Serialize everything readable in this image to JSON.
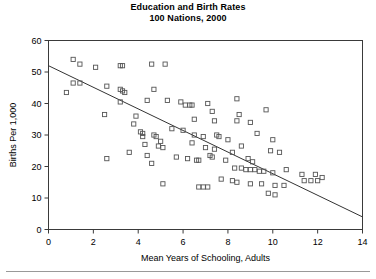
{
  "chart_data": {
    "type": "scatter",
    "title": "Education and Birth Rates",
    "subtitle": "100 Nations, 2000",
    "xlabel": "Mean Years of Schooling, Adults",
    "ylabel": "Births Per 1,000",
    "xlim": [
      0,
      14
    ],
    "ylim": [
      0,
      60
    ],
    "xticks": [
      0,
      2,
      4,
      6,
      8,
      10,
      12,
      14
    ],
    "yticks": [
      0,
      10,
      20,
      30,
      40,
      50,
      60
    ],
    "xtick_labels": [
      "0",
      "2",
      "4",
      "6",
      "8",
      "10",
      "12",
      "14"
    ],
    "ytick_labels": [
      "0",
      "10",
      "20",
      "30",
      "40",
      "50",
      "60"
    ],
    "grid": false,
    "legend": false,
    "marker": "open-square",
    "marker_color": "#555555",
    "trendline": {
      "type": "linear",
      "x": [
        0,
        14
      ],
      "y": [
        52,
        4
      ],
      "slope": -3.43,
      "intercept": 52,
      "color": "#333333"
    },
    "points": [
      {
        "x": 1.1,
        "y": 54.0
      },
      {
        "x": 1.4,
        "y": 52.5
      },
      {
        "x": 2.1,
        "y": 51.5
      },
      {
        "x": 3.2,
        "y": 52.0
      },
      {
        "x": 3.3,
        "y": 52.0
      },
      {
        "x": 4.6,
        "y": 52.5
      },
      {
        "x": 5.2,
        "y": 52.5
      },
      {
        "x": 1.1,
        "y": 46.5
      },
      {
        "x": 1.4,
        "y": 46.5
      },
      {
        "x": 0.8,
        "y": 43.5
      },
      {
        "x": 2.6,
        "y": 45.5
      },
      {
        "x": 3.2,
        "y": 44.5
      },
      {
        "x": 3.3,
        "y": 44.0
      },
      {
        "x": 3.4,
        "y": 43.5
      },
      {
        "x": 4.7,
        "y": 44.5
      },
      {
        "x": 3.2,
        "y": 40.5
      },
      {
        "x": 5.3,
        "y": 41.0
      },
      {
        "x": 5.9,
        "y": 40.5
      },
      {
        "x": 6.1,
        "y": 39.5
      },
      {
        "x": 6.3,
        "y": 39.5
      },
      {
        "x": 6.4,
        "y": 39.5
      },
      {
        "x": 2.5,
        "y": 36.5
      },
      {
        "x": 3.9,
        "y": 36.0
      },
      {
        "x": 3.8,
        "y": 33.5
      },
      {
        "x": 4.4,
        "y": 41.0
      },
      {
        "x": 7.1,
        "y": 40.0
      },
      {
        "x": 8.4,
        "y": 41.5
      },
      {
        "x": 7.3,
        "y": 37.5
      },
      {
        "x": 8.5,
        "y": 36.5
      },
      {
        "x": 9.7,
        "y": 38.0
      },
      {
        "x": 8.4,
        "y": 34.5
      },
      {
        "x": 9.0,
        "y": 34.0
      },
      {
        "x": 6.5,
        "y": 35.0
      },
      {
        "x": 7.4,
        "y": 34.5
      },
      {
        "x": 4.1,
        "y": 31.0
      },
      {
        "x": 4.2,
        "y": 30.5
      },
      {
        "x": 4.2,
        "y": 29.5
      },
      {
        "x": 4.7,
        "y": 30.0
      },
      {
        "x": 4.8,
        "y": 29.5
      },
      {
        "x": 5.0,
        "y": 28.0
      },
      {
        "x": 4.3,
        "y": 27.0
      },
      {
        "x": 4.9,
        "y": 26.5
      },
      {
        "x": 5.1,
        "y": 26.0
      },
      {
        "x": 5.5,
        "y": 32.0
      },
      {
        "x": 6.0,
        "y": 31.5
      },
      {
        "x": 6.5,
        "y": 30.0
      },
      {
        "x": 6.9,
        "y": 29.5
      },
      {
        "x": 7.5,
        "y": 30.0
      },
      {
        "x": 7.6,
        "y": 29.5
      },
      {
        "x": 6.4,
        "y": 27.5
      },
      {
        "x": 7.0,
        "y": 26.0
      },
      {
        "x": 7.4,
        "y": 25.5
      },
      {
        "x": 8.0,
        "y": 28.5
      },
      {
        "x": 8.6,
        "y": 26.5
      },
      {
        "x": 9.3,
        "y": 30.5
      },
      {
        "x": 10.0,
        "y": 28.5
      },
      {
        "x": 9.9,
        "y": 25.0
      },
      {
        "x": 10.3,
        "y": 24.5
      },
      {
        "x": 5.7,
        "y": 23.0
      },
      {
        "x": 6.2,
        "y": 22.5
      },
      {
        "x": 6.6,
        "y": 22.0
      },
      {
        "x": 6.7,
        "y": 22.0
      },
      {
        "x": 7.2,
        "y": 23.5
      },
      {
        "x": 7.3,
        "y": 23.0
      },
      {
        "x": 7.9,
        "y": 22.0
      },
      {
        "x": 8.2,
        "y": 24.5
      },
      {
        "x": 8.9,
        "y": 22.5
      },
      {
        "x": 9.1,
        "y": 21.5
      },
      {
        "x": 3.6,
        "y": 24.5
      },
      {
        "x": 4.4,
        "y": 23.5
      },
      {
        "x": 4.6,
        "y": 21.0
      },
      {
        "x": 2.6,
        "y": 22.5
      },
      {
        "x": 8.3,
        "y": 19.5
      },
      {
        "x": 8.6,
        "y": 19.5
      },
      {
        "x": 8.8,
        "y": 19.0
      },
      {
        "x": 9.0,
        "y": 19.0
      },
      {
        "x": 9.2,
        "y": 19.0
      },
      {
        "x": 9.4,
        "y": 18.5
      },
      {
        "x": 9.6,
        "y": 18.5
      },
      {
        "x": 10.0,
        "y": 18.0
      },
      {
        "x": 10.6,
        "y": 19.0
      },
      {
        "x": 11.3,
        "y": 17.5
      },
      {
        "x": 11.9,
        "y": 17.5
      },
      {
        "x": 12.2,
        "y": 16.5
      },
      {
        "x": 11.4,
        "y": 15.5
      },
      {
        "x": 11.7,
        "y": 15.5
      },
      {
        "x": 12.0,
        "y": 15.5
      },
      {
        "x": 7.7,
        "y": 16.0
      },
      {
        "x": 8.2,
        "y": 15.5
      },
      {
        "x": 8.4,
        "y": 15.0
      },
      {
        "x": 9.0,
        "y": 14.5
      },
      {
        "x": 9.5,
        "y": 14.5
      },
      {
        "x": 10.1,
        "y": 14.0
      },
      {
        "x": 10.5,
        "y": 14.0
      },
      {
        "x": 6.7,
        "y": 13.5
      },
      {
        "x": 6.9,
        "y": 13.5
      },
      {
        "x": 7.1,
        "y": 13.5
      },
      {
        "x": 5.1,
        "y": 14.5
      },
      {
        "x": 9.8,
        "y": 11.5
      },
      {
        "x": 10.1,
        "y": 11.0
      }
    ]
  }
}
